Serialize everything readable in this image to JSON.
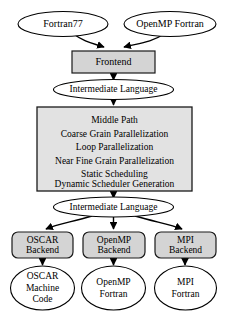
{
  "diagram": {
    "colors": {
      "box_fill": "#d4d4d4",
      "middle_box_fill": "#e2e2e2",
      "ellipse_fill": "#ffffff",
      "stroke": "#000000"
    },
    "inputs": [
      {
        "id": "fortran77",
        "label": "Fortran77"
      },
      {
        "id": "openmp_fortran",
        "label": "OpenMP Fortran"
      }
    ],
    "frontend": {
      "id": "frontend",
      "label": "Frontend"
    },
    "intermediate_upper": {
      "id": "intermediate-language-upper",
      "label": "Intermediate Language"
    },
    "middle_path": {
      "id": "middle-path",
      "lines": [
        "Middle Path",
        "Coarse Grain Parallelization",
        "Loop Parallelization",
        "Near Fine Grain Parallelization",
        "Static Scheduling",
        "Dynamic Scheduler Generation"
      ]
    },
    "intermediate_lower": {
      "id": "intermediate-language-lower",
      "label": "Intermediate Language"
    },
    "backends": [
      {
        "id": "oscar-backend",
        "line1": "OSCAR",
        "line2": "Backend"
      },
      {
        "id": "openmp-backend",
        "line1": "OpenMP",
        "line2": "Backend"
      },
      {
        "id": "mpi-backend",
        "line1": "MPI",
        "line2": "Backend"
      }
    ],
    "outputs": [
      {
        "id": "oscar-machine-code",
        "line1": "OSCAR",
        "line2": "Machine",
        "line3": "Code"
      },
      {
        "id": "openmp-fortran-output",
        "line1": "OpenMP",
        "line2": "Fortran",
        "line3": ""
      },
      {
        "id": "mpi-fortran-output",
        "line1": "MPI",
        "line2": "Fortran",
        "line3": ""
      }
    ]
  }
}
